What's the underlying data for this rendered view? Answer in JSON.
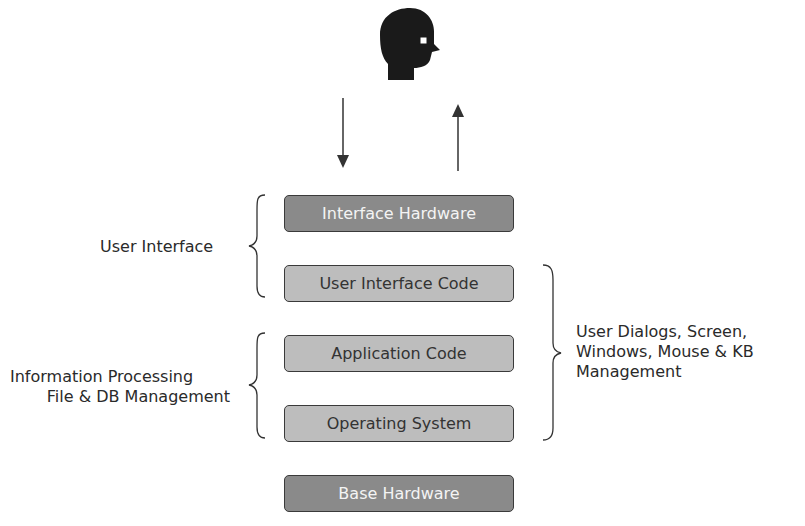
{
  "layers": [
    {
      "label": "Interface Hardware",
      "style": "dark"
    },
    {
      "label": "User Interface Code",
      "style": "light"
    },
    {
      "label": "Application Code",
      "style": "light"
    },
    {
      "label": "Operating System",
      "style": "light"
    },
    {
      "label": "Base Hardware",
      "style": "dark"
    }
  ],
  "left_labels": {
    "user_interface": "User Interface",
    "info_line1": "Information Processing",
    "info_line2": "File & DB Management"
  },
  "right_label": {
    "line1": "User Dialogs, Screen,",
    "line2": "Windows, Mouse & KB",
    "line3": "Management"
  },
  "icons": {
    "user": "user-head-icon",
    "down_arrow": "arrow-down-icon",
    "up_arrow": "arrow-up-icon"
  },
  "colors": {
    "dark_layer": "#8a8a8a",
    "light_layer": "#bdbdbd",
    "stroke": "#3a3a3a"
  }
}
